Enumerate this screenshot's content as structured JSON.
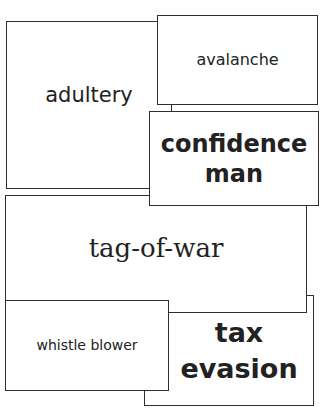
{
  "cards": [
    {
      "id": "adultery",
      "label": "adultery"
    },
    {
      "id": "avalanche",
      "label": "avalanche"
    },
    {
      "id": "confidence-man",
      "label": "confidence man"
    },
    {
      "id": "tag-of-war",
      "label": "tag-of-war"
    },
    {
      "id": "tax-evasion",
      "label": "tax evasion"
    },
    {
      "id": "whistle-blower",
      "label": "whistle blower"
    }
  ],
  "colors": {
    "background": "#ffffff",
    "border": "#2e2e2e",
    "text": "#222222"
  }
}
